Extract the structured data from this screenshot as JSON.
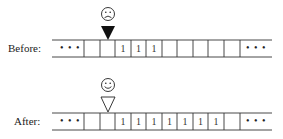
{
  "before": {
    "label": "Before:",
    "head_face": "sad-face",
    "head_style": "filled",
    "head_cell": 1,
    "left_ellipsis": "• • •",
    "right_ellipsis": "• • •",
    "cells": [
      "",
      "",
      "1",
      "1",
      "1",
      "",
      "",
      "",
      "",
      ""
    ]
  },
  "after": {
    "label": "After:",
    "head_face": "happy-face",
    "head_style": "outline",
    "head_cell": 1,
    "left_ellipsis": "• • •",
    "right_ellipsis": "• • •",
    "cells": [
      "",
      "",
      "1",
      "1",
      "1",
      "1",
      "1",
      "1",
      "1",
      ""
    ]
  }
}
